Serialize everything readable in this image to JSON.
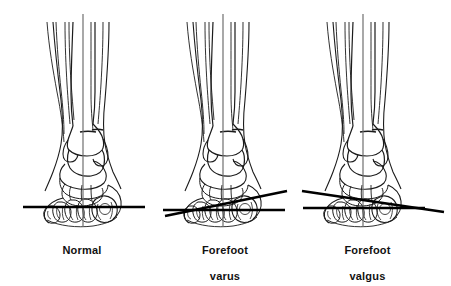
{
  "figure": {
    "type": "medical-illustration",
    "view": "anterior view of ankle and foot skeleton",
    "background_color": "#ffffff",
    "line_color": "#000000",
    "reference_line_color": "#6b6b6b",
    "ground_line_color": "#000000",
    "panels": [
      {
        "id": "normal",
        "caption_line1": "Normal",
        "caption_line2": "",
        "caption": "Normal",
        "ground_line": {
          "type": "horizontal",
          "angle_deg": 0
        },
        "second_line": null,
        "vertical_reference_line": true
      },
      {
        "id": "forefoot-varus",
        "caption_line1": "Forefoot",
        "caption_line2": "varus",
        "caption": "Forefoot varus",
        "ground_line": {
          "type": "horizontal",
          "angle_deg": 0
        },
        "second_line": {
          "type": "angled",
          "direction": "rises to the right",
          "angle_deg": -10
        },
        "vertical_reference_line": true
      },
      {
        "id": "forefoot-valgus",
        "caption_line1": "Forefoot",
        "caption_line2": "valgus",
        "caption": "Forefoot valgus",
        "ground_line": {
          "type": "horizontal",
          "angle_deg": 0
        },
        "second_line": {
          "type": "angled",
          "direction": "falls to the right",
          "angle_deg": 9
        },
        "vertical_reference_line": true
      }
    ]
  }
}
